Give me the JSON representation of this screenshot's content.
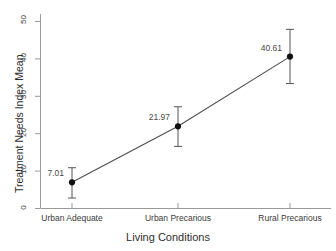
{
  "chart_data": {
    "type": "line",
    "title": "",
    "xlabel": "Living Conditions",
    "ylabel": "Treatment Needs Index Mean",
    "categories": [
      "Urban Adequate",
      "Urban Precarious",
      "Rural Precarious"
    ],
    "values": [
      7.01,
      21.97,
      40.61
    ],
    "point_labels": [
      "7.01",
      "21.97",
      "40.61"
    ],
    "error_bars": {
      "lower": [
        2.8,
        16.6,
        33.4
      ],
      "upper": [
        10.9,
        27.2,
        47.9
      ]
    },
    "ylim": [
      0,
      52
    ],
    "yticks": [
      0,
      10,
      20,
      30,
      40,
      50
    ],
    "ytick_labels": [
      "0",
      "10",
      "20",
      "30",
      "40",
      "50"
    ],
    "grid": false,
    "legend": "none",
    "marker": "filled-circle",
    "line_color": "#4d4d4d",
    "marker_color": "#111111",
    "axis_color": "#9a9a9a",
    "text_color": "#3a3a3a"
  }
}
